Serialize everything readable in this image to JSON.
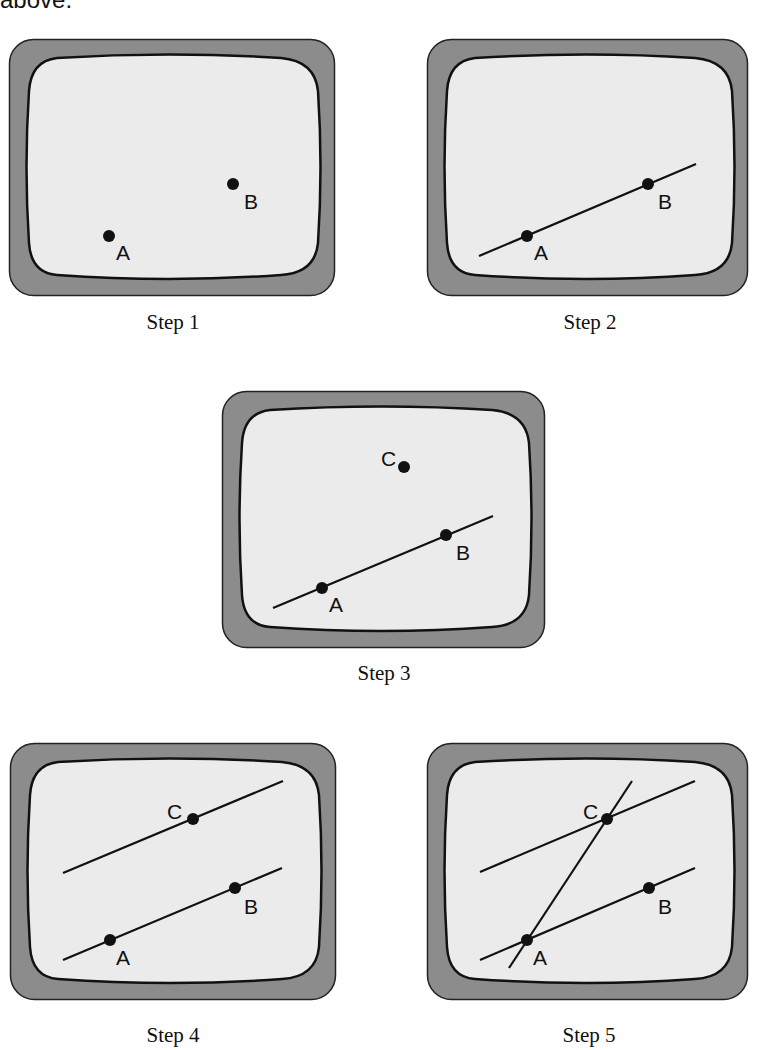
{
  "header": {
    "text": "above."
  },
  "colors": {
    "frame": "#8c8c8c",
    "screen": "#ebebeb",
    "ink": "#111111"
  },
  "steps": [
    {
      "caption": "Step 1",
      "points": [
        {
          "name": "A",
          "label": "A"
        },
        {
          "name": "B",
          "label": "B"
        }
      ]
    },
    {
      "caption": "Step 2",
      "points": [
        {
          "name": "A",
          "label": "A"
        },
        {
          "name": "B",
          "label": "B"
        }
      ],
      "lines": [
        "line AB"
      ]
    },
    {
      "caption": "Step 3",
      "points": [
        {
          "name": "A",
          "label": "A"
        },
        {
          "name": "B",
          "label": "B"
        },
        {
          "name": "C",
          "label": "C"
        }
      ],
      "lines": [
        "line AB"
      ]
    },
    {
      "caption": "Step 4",
      "points": [
        {
          "name": "A",
          "label": "A"
        },
        {
          "name": "B",
          "label": "B"
        },
        {
          "name": "C",
          "label": "C"
        }
      ],
      "lines": [
        "line AB",
        "line through C parallel to AB"
      ]
    },
    {
      "caption": "Step 5",
      "points": [
        {
          "name": "A",
          "label": "A"
        },
        {
          "name": "B",
          "label": "B"
        },
        {
          "name": "C",
          "label": "C"
        }
      ],
      "lines": [
        "line AB",
        "line through C parallel to AB",
        "line AC"
      ]
    }
  ]
}
